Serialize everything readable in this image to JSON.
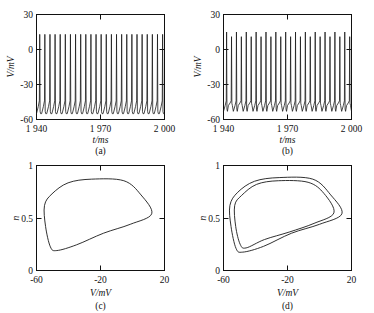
{
  "figure": {
    "background_color": "#ffffff",
    "line_color": "#1a1a1a",
    "panels": [
      "a",
      "b",
      "c",
      "d"
    ]
  },
  "chart_data": [
    {
      "type": "line",
      "panel": "a",
      "caption": "(a)",
      "title": "",
      "xlabel": "t/ms",
      "ylabel": "V/mV",
      "xlim": [
        1940,
        2000
      ],
      "ylim": [
        -60,
        30
      ],
      "xticks": [
        1940,
        1970,
        2000
      ],
      "xtick_labels": [
        "1 940",
        "1 970",
        "2 000"
      ],
      "yticks": [
        -60,
        -30,
        0,
        30
      ],
      "ytick_labels": [
        "-60",
        "-30",
        "0",
        "30"
      ],
      "grid": false,
      "legend": "none",
      "description": "Periodic tonic spiking membrane potential train, period-1, uniform spike amplitude",
      "spike_count": 25,
      "spike_period_ms": 2.4,
      "spike_peak_mV": 13,
      "spike_trough_mV": -55,
      "interspike_shoulder_mV": -44,
      "series": [
        {
          "name": "V(t)",
          "pattern": "period-1",
          "peaks_mV": [
            13,
            13,
            13,
            13,
            13,
            13,
            13,
            13,
            13,
            13,
            13,
            13,
            13,
            13,
            13,
            13,
            13,
            13,
            13,
            13,
            13,
            13,
            13,
            13,
            13
          ],
          "troughs_mV": [
            -55,
            -55,
            -55,
            -55,
            -55,
            -55,
            -55,
            -55,
            -55,
            -55,
            -55,
            -55,
            -55,
            -55,
            -55,
            -55,
            -55,
            -55,
            -55,
            -55,
            -55,
            -55,
            -55,
            -55,
            -55
          ]
        }
      ]
    },
    {
      "type": "line",
      "panel": "b",
      "caption": "(b)",
      "title": "",
      "xlabel": "t/ms",
      "ylabel": "V/mV",
      "xlim": [
        1940,
        2000
      ],
      "ylim": [
        -60,
        30
      ],
      "xticks": [
        1940,
        1970,
        2000
      ],
      "xtick_labels": [
        "1 940",
        "1 970",
        "2 000"
      ],
      "yticks": [
        -60,
        -30,
        0,
        30
      ],
      "ytick_labels": [
        "-60",
        "-30",
        "0",
        "30"
      ],
      "grid": false,
      "legend": "none",
      "description": "Period-doubled spiking: alternating tall and short spike amplitudes with alternating trough depths",
      "spike_count": 26,
      "spike_period_ms": 2.3,
      "spike_peak_tall_mV": 15,
      "spike_peak_short_mV": 11,
      "spike_trough_deep_mV": -53,
      "spike_trough_shallow_mV": -48,
      "series": [
        {
          "name": "V(t)",
          "pattern": "period-2",
          "peaks_mV": [
            15,
            11,
            15,
            11,
            15,
            11,
            15,
            11,
            15,
            11,
            15,
            11,
            15,
            11,
            15,
            11,
            15,
            11,
            15,
            11,
            15,
            11,
            15,
            11,
            15,
            11
          ],
          "troughs_mV": [
            -53,
            -48,
            -53,
            -48,
            -53,
            -48,
            -53,
            -48,
            -53,
            -48,
            -53,
            -48,
            -53,
            -48,
            -53,
            -48,
            -53,
            -48,
            -53,
            -48,
            -53,
            -48,
            -53,
            -48,
            -53,
            -48
          ]
        }
      ]
    },
    {
      "type": "line",
      "panel": "c",
      "caption": "(c)",
      "title": "",
      "xlabel": "V/mV",
      "ylabel": "n",
      "xlim": [
        -60,
        20
      ],
      "ylim": [
        0,
        1
      ],
      "xticks": [
        -60,
        -20,
        20
      ],
      "xtick_labels": [
        "-60",
        "-20",
        "20"
      ],
      "yticks": [
        0,
        0.5,
        1
      ],
      "ytick_labels": [
        "0",
        "0.5",
        "1"
      ],
      "grid": false,
      "legend": "none",
      "description": "Phase portrait, single closed limit cycle (period-1 orbit) in V-n plane",
      "orbit_count": 1,
      "orbit_v_range": [
        -55,
        12
      ],
      "orbit_n_range": [
        0.19,
        0.87
      ]
    },
    {
      "type": "line",
      "panel": "d",
      "caption": "(d)",
      "title": "",
      "xlabel": "V/mV",
      "ylabel": "n",
      "xlim": [
        -60,
        20
      ],
      "ylim": [
        0,
        1
      ],
      "xticks": [
        -60,
        -20,
        20
      ],
      "xtick_labels": [
        "-60",
        "-20",
        "20"
      ],
      "yticks": [
        0,
        0.5,
        1
      ],
      "ytick_labels": [
        "0",
        "0.5",
        "1"
      ],
      "grid": false,
      "legend": "none",
      "description": "Phase portrait, two nested closed loops (period-2 orbit after period doubling) in V-n plane",
      "orbit_count": 2,
      "outer_orbit_v_range": [
        -56,
        14
      ],
      "outer_orbit_n_range": [
        0.175,
        0.885
      ],
      "inner_orbit_v_range": [
        -53,
        9
      ],
      "inner_orbit_n_range": [
        0.215,
        0.855
      ]
    }
  ]
}
